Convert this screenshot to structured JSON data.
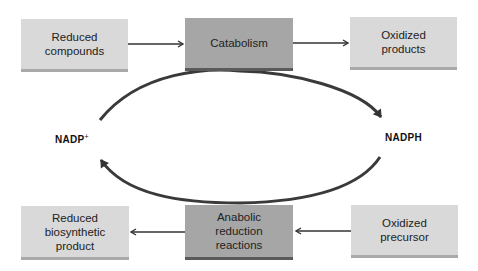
{
  "diagram": {
    "top_row": [
      {
        "id": "reduced-compounds",
        "label": "Reduced\ncompounds",
        "style": "light"
      },
      {
        "id": "catabolism",
        "label": "Catabolism",
        "style": "dark"
      },
      {
        "id": "oxidized-products",
        "label": "Oxidized\nproducts",
        "style": "light"
      }
    ],
    "bottom_row": [
      {
        "id": "reduced-biosynthetic-product",
        "label": "Reduced\nbiosynthetic\nproduct",
        "style": "light"
      },
      {
        "id": "anabolic-reduction-reactions",
        "label": "Anabolic\nreduction\nreactions",
        "style": "dark"
      },
      {
        "id": "oxidized-precursor",
        "label": "Oxidized\nprecursor",
        "style": "light"
      }
    ],
    "cycle_left_label": "NADP+",
    "cycle_left_label_base": "NADP",
    "cycle_left_label_sup": "+",
    "cycle_right_label": "NADPH",
    "edges": [
      {
        "from": "reduced-compounds",
        "to": "catabolism"
      },
      {
        "from": "catabolism",
        "to": "oxidized-products"
      },
      {
        "from": "oxidized-precursor",
        "to": "anabolic-reduction-reactions"
      },
      {
        "from": "anabolic-reduction-reactions",
        "to": "reduced-biosynthetic-product"
      },
      {
        "from": "NADP+",
        "to": "NADPH",
        "via": "catabolism"
      },
      {
        "from": "NADPH",
        "to": "NADP+",
        "via": "anabolic-reduction-reactions"
      }
    ],
    "colors": {
      "light_box": "#d9d9d9",
      "dark_box": "#a6a6a6",
      "arrow": "#333333"
    }
  }
}
